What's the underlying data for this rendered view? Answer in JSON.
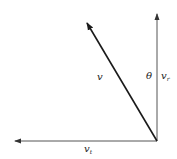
{
  "diagram": {
    "type": "vector-decomposition",
    "colors": {
      "stroke": "#1a1a1a",
      "axis": "#555555",
      "background": "#ffffff"
    },
    "vectors": [
      {
        "id": "v",
        "label": "v",
        "from": [
          157,
          141
        ],
        "to": [
          86,
          22
        ]
      },
      {
        "id": "v_r",
        "label": "v",
        "subscript": "r",
        "from": [
          157,
          141
        ],
        "to": [
          157,
          13
        ]
      },
      {
        "id": "v_t",
        "label": "v",
        "subscript": "t",
        "from": [
          157,
          141
        ],
        "to": [
          14,
          141
        ]
      }
    ],
    "angle_label": "θ"
  }
}
